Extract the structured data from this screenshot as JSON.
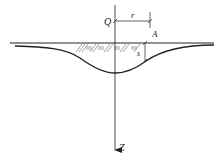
{
  "diagram": {
    "labels": {
      "load": "Q",
      "radius": "r",
      "point": "A",
      "settlement": "s",
      "depth_axis": "Z"
    },
    "colors": {
      "line": "#222222",
      "hatch": "#555555",
      "background": "#ffffff"
    }
  }
}
